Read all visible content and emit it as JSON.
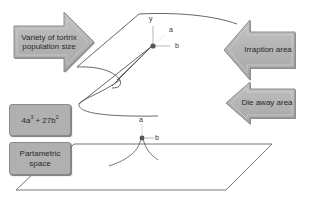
{
  "labels": {
    "variety": "Variety of tortrix population size",
    "variety_line1": "Variety of tortrix",
    "variety_line2": "population size",
    "irruption": "Irraption area",
    "die_away": "Die away area",
    "formula": "4a³ + 27b²",
    "formula_base1": "4a",
    "formula_exp1": "3",
    "formula_mid": " + 27b",
    "formula_exp2": "2",
    "parametric_line1": "Partametric",
    "parametric_line2": "space"
  },
  "axes_top": {
    "y": "y",
    "a": "a",
    "b": "b"
  },
  "axes_bottom": {
    "a": "a",
    "b": "b"
  },
  "colors": {
    "arrow_fill": "#b3b3b3",
    "arrow_stroke": "#8c8c8c",
    "line": "#555555"
  }
}
